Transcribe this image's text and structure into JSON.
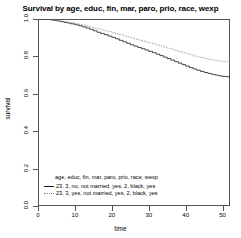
{
  "chart_data": {
    "type": "line",
    "title": "Survival by age, educ, fin, mar, paro, prio, race, wexp",
    "xlabel": "time",
    "ylabel": "survival",
    "xlim": [
      0,
      52
    ],
    "ylim": [
      0,
      1
    ],
    "xticks": [
      "0",
      "10",
      "20",
      "30",
      "40",
      "50"
    ],
    "xtick_values": [
      0,
      10,
      20,
      30,
      40,
      50
    ],
    "yticks": [
      "0.0",
      "0.2",
      "0.4",
      "0.6",
      "0.8",
      "1.0"
    ],
    "ytick_values": [
      0.0,
      0.2,
      0.4,
      0.6,
      0.8,
      1.0
    ],
    "grid": false,
    "legend_position": "bottom-left",
    "legend_title": "age, educ, fin, mar, paro, prio, race, wexp",
    "series": [
      {
        "name": "23, 3, no, not married, yes, 2, black, yes",
        "linestyle": "solid",
        "color": "#1a1a1a",
        "x": [
          0,
          1,
          2,
          3,
          4,
          5,
          6,
          7,
          8,
          9,
          10,
          11,
          12,
          13,
          14,
          15,
          16,
          17,
          18,
          19,
          20,
          21,
          22,
          23,
          24,
          25,
          26,
          27,
          28,
          29,
          30,
          31,
          32,
          33,
          34,
          35,
          36,
          37,
          38,
          39,
          40,
          41,
          42,
          43,
          44,
          45,
          46,
          47,
          48,
          49,
          50,
          51,
          52
        ],
        "y": [
          1.0,
          1.0,
          0.998,
          0.996,
          0.993,
          0.99,
          0.986,
          0.982,
          0.978,
          0.974,
          0.969,
          0.964,
          0.958,
          0.952,
          0.945,
          0.937,
          0.929,
          0.922,
          0.916,
          0.909,
          0.902,
          0.894,
          0.886,
          0.878,
          0.87,
          0.862,
          0.855,
          0.848,
          0.841,
          0.834,
          0.827,
          0.82,
          0.812,
          0.804,
          0.796,
          0.788,
          0.78,
          0.772,
          0.764,
          0.756,
          0.748,
          0.74,
          0.733,
          0.726,
          0.72,
          0.714,
          0.709,
          0.704,
          0.7,
          0.696,
          0.693,
          0.691,
          0.69
        ]
      },
      {
        "name": "23, 3, yes, not married, yes, 2, black, yes",
        "linestyle": "dotted",
        "color": "#8a8a8a",
        "x": [
          0,
          1,
          2,
          3,
          4,
          5,
          6,
          7,
          8,
          9,
          10,
          11,
          12,
          13,
          14,
          15,
          16,
          17,
          18,
          19,
          20,
          21,
          22,
          23,
          24,
          25,
          26,
          27,
          28,
          29,
          30,
          31,
          32,
          33,
          34,
          35,
          36,
          37,
          38,
          39,
          40,
          41,
          42,
          43,
          44,
          45,
          46,
          47,
          48,
          49,
          50,
          51,
          52
        ],
        "y": [
          1.0,
          1.0,
          0.999,
          0.997,
          0.995,
          0.992,
          0.989,
          0.986,
          0.983,
          0.98,
          0.976,
          0.972,
          0.968,
          0.963,
          0.958,
          0.952,
          0.947,
          0.942,
          0.937,
          0.932,
          0.927,
          0.921,
          0.916,
          0.91,
          0.904,
          0.899,
          0.893,
          0.888,
          0.883,
          0.878,
          0.873,
          0.867,
          0.862,
          0.856,
          0.85,
          0.844,
          0.838,
          0.832,
          0.826,
          0.82,
          0.814,
          0.809,
          0.803,
          0.798,
          0.793,
          0.789,
          0.785,
          0.781,
          0.778,
          0.775,
          0.773,
          0.772,
          0.771
        ]
      }
    ]
  }
}
